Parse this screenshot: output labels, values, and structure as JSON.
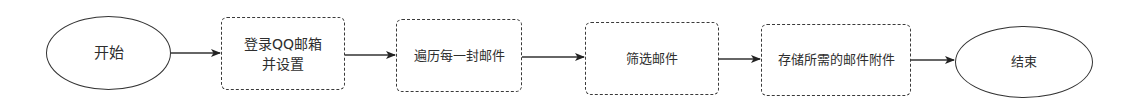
{
  "diagram": {
    "type": "flowchart",
    "direction": "left-to-right",
    "colors": {
      "stroke": "#333333",
      "text": "#2e2e2e",
      "background": "#ffffff"
    },
    "nodes": [
      {
        "id": "start",
        "shape": "ellipse",
        "label": "开始"
      },
      {
        "id": "login",
        "shape": "rounded-rect",
        "label": "登录QQ邮箱\n并设置"
      },
      {
        "id": "iterate",
        "shape": "rounded-rect",
        "label": "遍历每一封邮件"
      },
      {
        "id": "filter",
        "shape": "rounded-rect",
        "label": "筛选邮件"
      },
      {
        "id": "store",
        "shape": "rounded-rect",
        "label": "存储所需的邮件附件"
      },
      {
        "id": "end",
        "shape": "ellipse",
        "label": "结束"
      }
    ],
    "edges": [
      {
        "from": "start",
        "to": "login"
      },
      {
        "from": "login",
        "to": "iterate"
      },
      {
        "from": "iterate",
        "to": "filter"
      },
      {
        "from": "filter",
        "to": "store"
      },
      {
        "from": "store",
        "to": "end"
      }
    ]
  }
}
